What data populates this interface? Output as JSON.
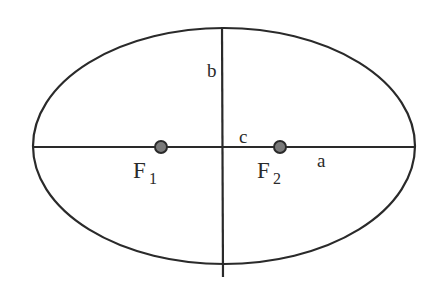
{
  "diagram": {
    "type": "ellipse-geometry",
    "colors": {
      "stroke": "#2a2a2a",
      "focus_fill": "#7a7a7a",
      "background": "#ffffff"
    },
    "ellipse": {
      "cx": 224,
      "cy": 146,
      "rx": 191,
      "ry": 118
    },
    "major_axis": {
      "x1": 33,
      "y1": 147,
      "x2": 416,
      "y2": 147
    },
    "minor_axis": {
      "x1": 222,
      "y1": 27,
      "x2": 223,
      "y2": 277
    },
    "foci": [
      {
        "id": "F1",
        "cx": 161,
        "cy": 147,
        "r": 6,
        "label": "F",
        "subscript": "1"
      },
      {
        "id": "F2",
        "cx": 280,
        "cy": 147,
        "r": 6,
        "label": "F",
        "subscript": "2"
      }
    ],
    "labels": {
      "semi_minor": "b",
      "focal_distance": "c",
      "semi_major": "a"
    }
  }
}
